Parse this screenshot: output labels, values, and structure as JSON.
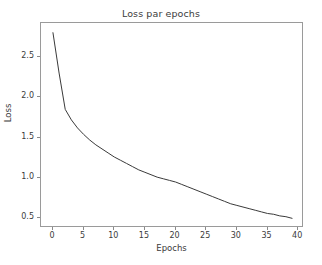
{
  "chart_data": {
    "type": "line",
    "title": "Loss par epochs",
    "xlabel": "Epochs",
    "ylabel": "Loss",
    "xlim": [
      -1.95,
      40.95
    ],
    "ylim": [
      0.38,
      2.92
    ],
    "grid": false,
    "legend": null,
    "line_color": "#3a3a3a",
    "line_width": 1.0,
    "xticks": [
      0,
      5,
      10,
      15,
      20,
      25,
      30,
      35,
      40
    ],
    "xticklabels": [
      "0",
      "5",
      "10",
      "15",
      "20",
      "25",
      "30",
      "35",
      "40"
    ],
    "yticks": [
      0.5,
      1.0,
      1.5,
      2.0,
      2.5
    ],
    "yticklabels": [
      "0.5",
      "1.0",
      "1.5",
      "2.0",
      "2.5"
    ],
    "series": [
      {
        "name": "loss",
        "x": [
          0,
          1,
          2,
          3,
          4,
          5,
          6,
          7,
          8,
          9,
          10,
          11,
          12,
          13,
          14,
          15,
          16,
          17,
          18,
          19,
          20,
          21,
          22,
          23,
          24,
          25,
          26,
          27,
          28,
          29,
          30,
          31,
          32,
          33,
          34,
          35,
          36,
          37,
          38,
          39
        ],
        "values": [
          2.8,
          2.3,
          1.85,
          1.72,
          1.62,
          1.54,
          1.47,
          1.41,
          1.36,
          1.31,
          1.26,
          1.22,
          1.18,
          1.14,
          1.1,
          1.07,
          1.04,
          1.01,
          0.99,
          0.97,
          0.95,
          0.92,
          0.89,
          0.86,
          0.83,
          0.8,
          0.77,
          0.74,
          0.71,
          0.68,
          0.66,
          0.64,
          0.62,
          0.6,
          0.58,
          0.56,
          0.55,
          0.53,
          0.52,
          0.5
        ]
      }
    ]
  },
  "figure": {
    "background_color": "#ffffff",
    "axes_edge_color": "#9a9a9a",
    "text_color": "#3b3b3b"
  }
}
